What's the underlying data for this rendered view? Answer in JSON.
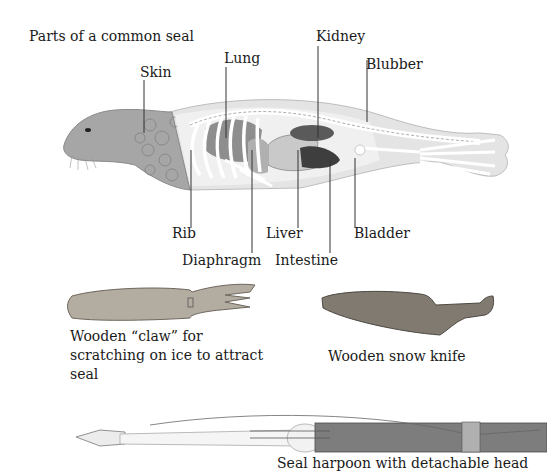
{
  "diagram": {
    "title": "Parts of a common seal",
    "labels": {
      "skin": "Skin",
      "lung": "Lung",
      "kidney": "Kidney",
      "blubber": "Blubber",
      "rib": "Rib",
      "diaphragm": "Diaphragm",
      "liver": "Liver",
      "intestine": "Intestine",
      "bladder": "Bladder"
    }
  },
  "tools": {
    "claw": {
      "caption_line1": "Wooden “claw” for",
      "caption_line2": "scratching on ice to attract",
      "caption_line3": "seal"
    },
    "snow_knife": {
      "caption": "Wooden snow knife"
    },
    "harpoon": {
      "caption": "Seal harpoon with detachable head"
    }
  },
  "colors": {
    "skin": "#9c9c9c",
    "blubber": "#e2e2e2",
    "bone": "#ffffff",
    "kidney": "#555555",
    "intestine": "#3c3c3c",
    "wood": "#8e8478",
    "text": "#1a1a1a"
  }
}
